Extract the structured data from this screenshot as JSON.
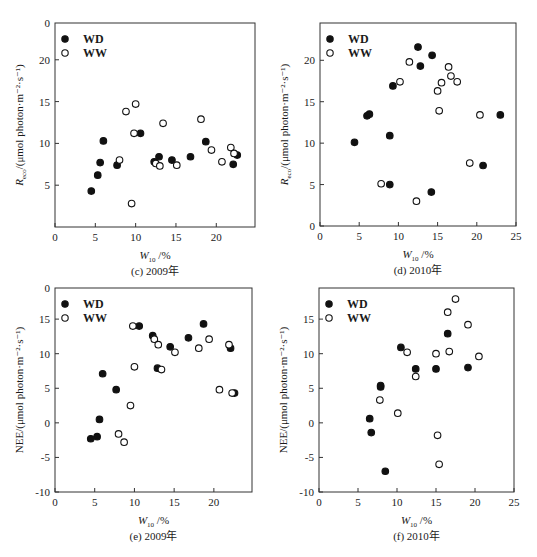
{
  "chart_data": [
    {
      "id": "c",
      "type": "scatter",
      "caption": "(c) 2009年",
      "xlabel": "W10 /%",
      "ylabel": "Reco/(μmol photon·m⁻²·s⁻¹)",
      "xlim": [
        0,
        24.8
      ],
      "ylim": [
        0,
        24.4
      ],
      "xticks": [
        0,
        5,
        10,
        15,
        20
      ],
      "yticks": [
        5,
        10,
        15,
        20
      ],
      "ytick_top_label": "0",
      "legend": {
        "position": "upper-left",
        "entries": [
          "WD",
          "WW"
        ]
      },
      "grid": false,
      "series": [
        {
          "name": "WD",
          "marker": "filled-circle",
          "points": [
            [
              4.5,
              4.3
            ],
            [
              5.3,
              6.2
            ],
            [
              5.6,
              7.7
            ],
            [
              6.0,
              10.3
            ],
            [
              7.7,
              7.4
            ],
            [
              10.6,
              11.2
            ],
            [
              12.3,
              7.8
            ],
            [
              12.9,
              8.4
            ],
            [
              14.5,
              8.0
            ],
            [
              16.8,
              8.4
            ],
            [
              18.7,
              10.2
            ],
            [
              22.1,
              7.5
            ],
            [
              22.6,
              8.6
            ]
          ]
        },
        {
          "name": "WW",
          "marker": "open-circle",
          "points": [
            [
              8.0,
              8.0
            ],
            [
              8.8,
              13.8
            ],
            [
              9.5,
              2.8
            ],
            [
              9.8,
              11.2
            ],
            [
              10.0,
              14.7
            ],
            [
              12.5,
              7.6
            ],
            [
              13.0,
              7.3
            ],
            [
              13.4,
              12.4
            ],
            [
              15.1,
              7.4
            ],
            [
              18.1,
              12.9
            ],
            [
              19.4,
              9.2
            ],
            [
              20.7,
              7.8
            ],
            [
              21.8,
              9.5
            ],
            [
              22.2,
              8.8
            ]
          ]
        }
      ]
    },
    {
      "id": "d",
      "type": "scatter",
      "caption": "(d) 2010年",
      "xlabel": "W10 /%",
      "ylabel": "Reco/(μmol photon·m⁻²·s⁻¹)",
      "xlim": [
        0,
        25
      ],
      "ylim": [
        0,
        24.5
      ],
      "xticks": [
        0,
        5,
        10,
        15,
        20,
        25
      ],
      "yticks": [
        0,
        5,
        10,
        15,
        20
      ],
      "legend": {
        "position": "upper-left",
        "entries": [
          "WD",
          "WW"
        ]
      },
      "grid": false,
      "series": [
        {
          "name": "WD",
          "marker": "filled-circle",
          "points": [
            [
              4.4,
              10.1
            ],
            [
              6.0,
              13.3
            ],
            [
              6.3,
              13.5
            ],
            [
              8.9,
              10.9
            ],
            [
              8.9,
              5.0
            ],
            [
              9.3,
              16.9
            ],
            [
              12.5,
              21.6
            ],
            [
              12.8,
              19.3
            ],
            [
              14.3,
              20.6
            ],
            [
              14.2,
              4.1
            ],
            [
              20.8,
              7.3
            ],
            [
              23.0,
              13.4
            ]
          ]
        },
        {
          "name": "WW",
          "marker": "open-circle",
          "points": [
            [
              7.8,
              5.1
            ],
            [
              10.2,
              17.4
            ],
            [
              11.4,
              19.8
            ],
            [
              12.3,
              3.0
            ],
            [
              15.0,
              16.3
            ],
            [
              15.2,
              13.9
            ],
            [
              15.5,
              17.3
            ],
            [
              16.4,
              19.2
            ],
            [
              16.7,
              18.1
            ],
            [
              17.5,
              17.4
            ],
            [
              19.1,
              7.6
            ],
            [
              20.4,
              13.4
            ]
          ]
        }
      ]
    },
    {
      "id": "e",
      "type": "scatter",
      "caption": "(e) 2009年",
      "xlabel": "W10 /%",
      "ylabel": "NEE/(μmol photon·m⁻²·s⁻¹)",
      "xlim": [
        0,
        24.8
      ],
      "ylim": [
        -10,
        19.5
      ],
      "xticks": [
        0,
        5,
        10,
        15,
        20
      ],
      "yticks": [
        -10,
        -5,
        0,
        5,
        10,
        15
      ],
      "ytick_top_label": "0",
      "legend": {
        "position": "upper-left",
        "entries": [
          "WD",
          "WW"
        ]
      },
      "grid": false,
      "series": [
        {
          "name": "WD",
          "marker": "filled-circle",
          "points": [
            [
              4.5,
              -2.3
            ],
            [
              5.3,
              -2.0
            ],
            [
              5.6,
              0.5
            ],
            [
              6.0,
              7.1
            ],
            [
              7.7,
              4.8
            ],
            [
              10.6,
              14.0
            ],
            [
              12.3,
              12.6
            ],
            [
              12.9,
              7.9
            ],
            [
              14.5,
              11.0
            ],
            [
              16.8,
              12.3
            ],
            [
              18.7,
              14.3
            ],
            [
              22.1,
              10.8
            ],
            [
              22.6,
              4.3
            ]
          ]
        },
        {
          "name": "WW",
          "marker": "open-circle",
          "points": [
            [
              8.0,
              -1.6
            ],
            [
              8.7,
              -2.8
            ],
            [
              9.5,
              2.5
            ],
            [
              9.8,
              14.0
            ],
            [
              10.0,
              8.1
            ],
            [
              12.5,
              12.1
            ],
            [
              13.0,
              11.3
            ],
            [
              13.4,
              7.7
            ],
            [
              15.1,
              10.2
            ],
            [
              18.1,
              10.8
            ],
            [
              19.4,
              12.1
            ],
            [
              20.7,
              4.8
            ],
            [
              21.9,
              11.3
            ],
            [
              22.3,
              4.3
            ]
          ]
        }
      ]
    },
    {
      "id": "f",
      "type": "scatter",
      "caption": "(f) 2010年",
      "xlabel": "W10 /%",
      "ylabel": "NEE/(μmol photon·m⁻²·s⁻¹)",
      "xlim": [
        0,
        25
      ],
      "ylim": [
        -10,
        19.5
      ],
      "xticks": [
        0,
        5,
        10,
        15,
        20,
        25
      ],
      "yticks": [
        -10,
        -5,
        0,
        5,
        10,
        15
      ],
      "legend": {
        "position": "upper-left",
        "entries": [
          "WD",
          "WW"
        ]
      },
      "grid": false,
      "series": [
        {
          "name": "WD",
          "marker": "filled-circle",
          "points": [
            [
              6.5,
              0.6
            ],
            [
              6.7,
              -1.4
            ],
            [
              7.9,
              5.2
            ],
            [
              7.9,
              5.4
            ],
            [
              8.5,
              -7.0
            ],
            [
              10.5,
              10.9
            ],
            [
              12.4,
              7.8
            ],
            [
              15.0,
              7.8
            ],
            [
              16.5,
              12.9
            ],
            [
              19.1,
              8.0
            ]
          ]
        },
        {
          "name": "WW",
          "marker": "open-circle",
          "points": [
            [
              7.8,
              3.3
            ],
            [
              10.1,
              1.4
            ],
            [
              11.3,
              10.2
            ],
            [
              12.4,
              6.7
            ],
            [
              15.0,
              10.0
            ],
            [
              15.2,
              -1.8
            ],
            [
              15.4,
              -6.0
            ],
            [
              16.5,
              16.0
            ],
            [
              16.7,
              10.3
            ],
            [
              17.5,
              17.9
            ],
            [
              19.1,
              14.2
            ],
            [
              20.5,
              9.6
            ]
          ]
        }
      ]
    }
  ]
}
